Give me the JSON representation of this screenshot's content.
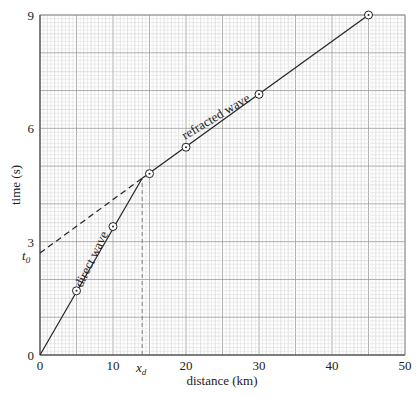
{
  "chart_data": {
    "type": "line",
    "title": "",
    "xlabel": "distance (km)",
    "ylabel": "time (s)",
    "xlim": [
      0,
      50
    ],
    "ylim": [
      0,
      9
    ],
    "x_ticks": [
      0,
      10,
      20,
      30,
      40,
      50
    ],
    "y_ticks": [
      0,
      3,
      6,
      9
    ],
    "grid": true,
    "legend": null,
    "points": [
      {
        "x": 5,
        "y": 1.7
      },
      {
        "x": 10,
        "y": 3.4
      },
      {
        "x": 15,
        "y": 4.8
      },
      {
        "x": 20,
        "y": 5.5
      },
      {
        "x": 30,
        "y": 6.9
      },
      {
        "x": 45,
        "y": 9.0
      }
    ],
    "series": [
      {
        "name": "direct wave",
        "style": "solid",
        "x": [
          0,
          14
        ],
        "y": [
          0,
          4.68
        ]
      },
      {
        "name": "refracted wave",
        "style": "solid",
        "x": [
          14,
          45
        ],
        "y": [
          4.68,
          9.0
        ]
      },
      {
        "name": "refracted wave extrapolation",
        "style": "dashed",
        "x": [
          0,
          14
        ],
        "y": [
          2.7,
          4.68
        ]
      },
      {
        "name": "crossover drop line",
        "style": "dashed",
        "x": [
          14,
          14
        ],
        "y": [
          0,
          4.68
        ]
      }
    ],
    "annotations": [
      {
        "text": "direct wave",
        "along": "direct wave"
      },
      {
        "text": "refracted wave",
        "along": "refracted wave"
      },
      {
        "text": "t",
        "subscript": "0",
        "at_y": 2.7,
        "position": "left of y-axis"
      },
      {
        "text": "x",
        "subscript": "d",
        "at_x": 14,
        "position": "below x-axis"
      }
    ]
  },
  "labels": {
    "xlabel": "distance (km)",
    "ylabel": "time (s)",
    "direct": "direct wave",
    "refracted": "refracted wave",
    "t0_main": "t",
    "t0_sub": "0",
    "xd_main": "x",
    "xd_sub": "d"
  },
  "ticks": {
    "x": [
      "0",
      "10",
      "20",
      "30",
      "40",
      "50"
    ],
    "y": [
      "0",
      "3",
      "6",
      "9"
    ]
  }
}
